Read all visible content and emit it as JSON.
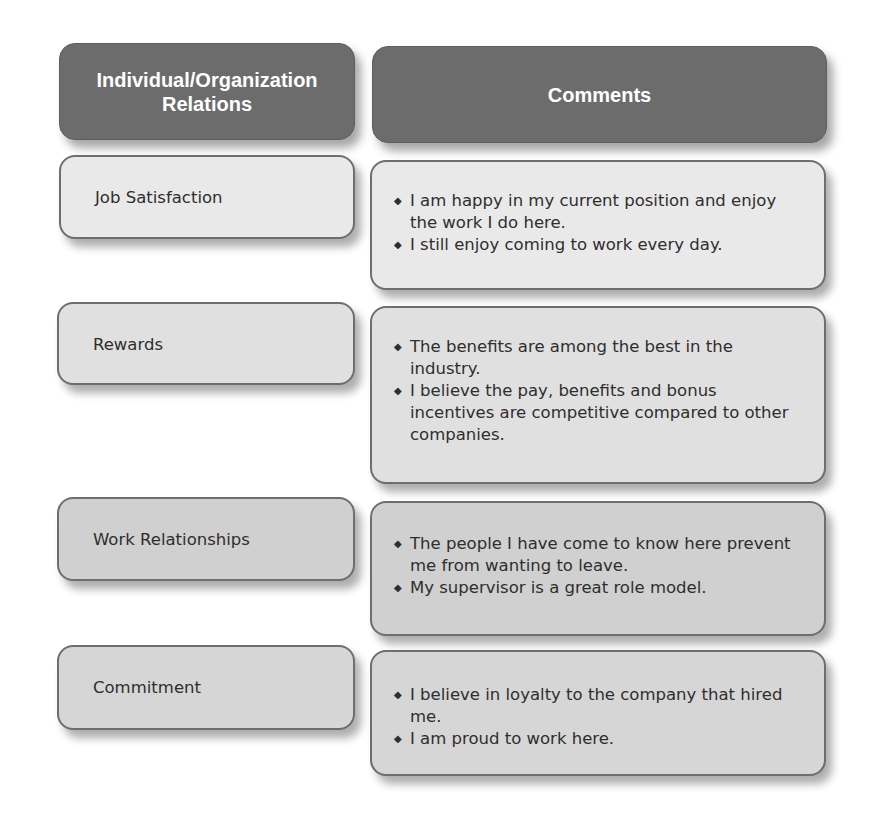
{
  "header": {
    "col1": "Individual/Organization Relations",
    "col1_line1": "Individual/Organization",
    "col1_line2": "Relations",
    "col2": "Comments"
  },
  "colors": {
    "header_bg": "#6c6c6c",
    "header_text": "#ffffff",
    "row1_bg": "#e9e9e9",
    "row2_bg": "#e0e0e0",
    "row3_bg": "#d0d0d0",
    "row4_bg": "#d6d6d6",
    "border": "#6e6e6e",
    "text": "#2e2e2e"
  },
  "bullet_icon": "diamond-bullet-icon",
  "rows": [
    {
      "label": "Job Satisfaction",
      "comments": [
        "I am happy in my current position and enjoy the work I do here.",
        "I still enjoy coming to work every day."
      ]
    },
    {
      "label": "Rewards",
      "comments": [
        "The benefits are among the best in the industry.",
        "I believe the pay, benefits and bonus incentives are competitive compared to other companies."
      ]
    },
    {
      "label": "Work Relationships",
      "comments": [
        "The people I have come to know here prevent me from wanting to leave.",
        "My supervisor is a great role model."
      ]
    },
    {
      "label": "Commitment",
      "comments": [
        "I believe in loyalty to the company that hired me.",
        "I am proud to work here."
      ]
    }
  ]
}
